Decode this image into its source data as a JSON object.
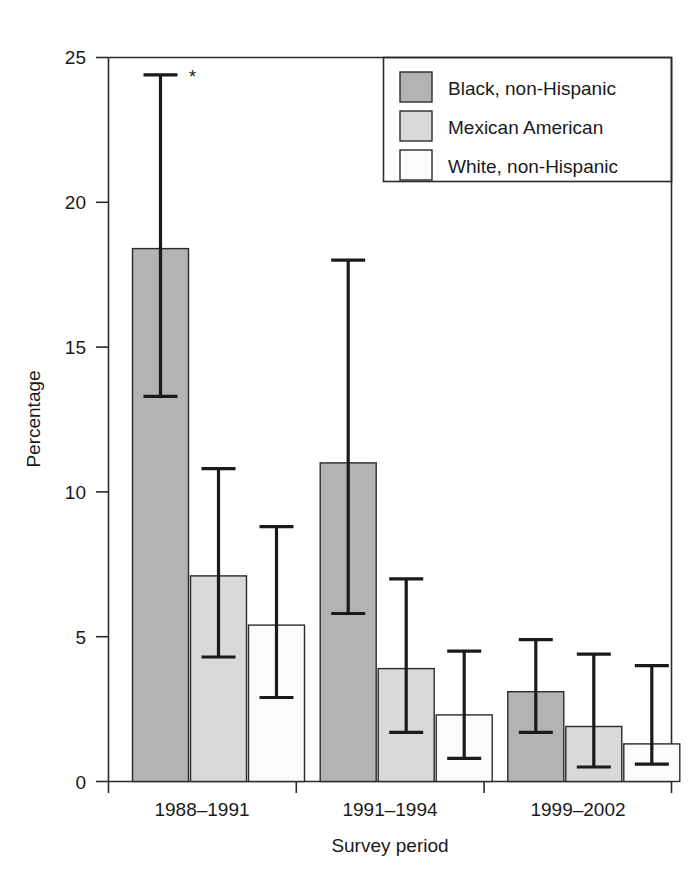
{
  "chart_data": {
    "type": "bar",
    "title": "",
    "subtitle": "",
    "xlabel": "Survey period",
    "ylabel": "Percentage",
    "categories": [
      "1988–1991",
      "1991–1994",
      "1999–2002"
    ],
    "ylim": [
      0,
      25
    ],
    "yticks": [
      0,
      5,
      10,
      15,
      20,
      25
    ],
    "ytick_labels": [
      "0",
      "5",
      "10",
      "15",
      "20",
      "25"
    ],
    "grid": false,
    "legend_position": "top-right",
    "error_bars": "95% confidence interval",
    "annotations": [
      {
        "text": "*",
        "series": "Black, non-Hispanic",
        "category": "1988–1991",
        "value": 24.4
      }
    ],
    "series": [
      {
        "name": "Black, non-Hispanic",
        "color": "#b3b3b3",
        "values": [
          18.4,
          11.0,
          3.1
        ],
        "err_low": [
          13.3,
          5.8,
          1.7
        ],
        "err_high": [
          24.4,
          18.0,
          4.9
        ]
      },
      {
        "name": "Mexican American",
        "color": "#d9d9d9",
        "values": [
          7.1,
          3.9,
          1.9
        ],
        "err_low": [
          4.3,
          1.7,
          0.5
        ],
        "err_high": [
          10.8,
          7.0,
          4.4
        ]
      },
      {
        "name": "White, non-Hispanic",
        "color": "#fbfbfb",
        "values": [
          5.4,
          2.3,
          1.3
        ],
        "err_low": [
          2.9,
          0.8,
          0.6
        ],
        "err_high": [
          8.8,
          4.5,
          4.0
        ]
      }
    ]
  },
  "legend": {
    "items": [
      {
        "label": "Black, non-Hispanic",
        "swatch": "#b3b3b3"
      },
      {
        "label": "Mexican American",
        "swatch": "#d9d9d9"
      },
      {
        "label": "White, non-Hispanic",
        "swatch": "#fbfbfb"
      }
    ]
  },
  "axes": {
    "y_title": "Percentage",
    "x_title": "Survey period",
    "y_ticks": [
      "25",
      "20",
      "15",
      "10",
      "5",
      "0"
    ],
    "x_ticks": [
      "1988–1991",
      "1991–1994",
      "1999–2002"
    ]
  },
  "colors": {
    "ink": "#1a1a1a",
    "axis": "#2b2b2b",
    "background": "#ffffff",
    "series_dark": "#b3b3b3",
    "series_mid": "#d9d9d9",
    "series_light": "#fbfbfb"
  },
  "marks": {
    "asterisk": "*"
  }
}
